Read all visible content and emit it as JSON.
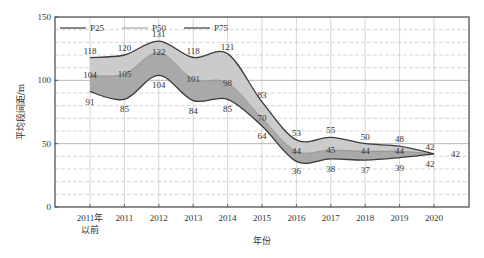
{
  "chart_data": {
    "type": "area",
    "title": "",
    "xlabel": "年份",
    "ylabel": "平均段间距/m",
    "ylim": [
      0,
      150
    ],
    "yticks": [
      0,
      50,
      100,
      150
    ],
    "grid": {
      "major_solid": [
        50,
        100
      ],
      "minor_dashed_step": 10,
      "vertical": true
    },
    "legend_position": "top-inside",
    "categories": [
      "2011年以前",
      "2011",
      "2012",
      "2013",
      "2014",
      "2015",
      "2016",
      "2017",
      "2018",
      "2019",
      "2020"
    ],
    "category_lines": [
      [
        "2011年",
        "以前"
      ],
      [
        "2011"
      ],
      [
        "2012"
      ],
      [
        "2013"
      ],
      [
        "2014"
      ],
      [
        "2015"
      ],
      [
        "2016"
      ],
      [
        "2017"
      ],
      [
        "2018"
      ],
      [
        "2019"
      ],
      [
        "2020"
      ]
    ],
    "series": [
      {
        "name": "P25",
        "values": [
          91,
          85,
          104,
          84,
          85,
          64,
          36,
          38,
          37,
          39,
          42
        ]
      },
      {
        "name": "P50",
        "values": [
          104,
          105,
          122,
          101,
          98,
          70,
          44,
          45,
          44,
          44,
          42
        ]
      },
      {
        "name": "P75",
        "values": [
          118,
          120,
          131,
          118,
          121,
          83,
          53,
          55,
          50,
          48,
          42
        ]
      }
    ],
    "colors": {
      "band_upper": "#cbcbcb",
      "band_lower": "#a9a9a9",
      "p75_line": "#3a3a3a",
      "p50_line": "#8a8a8a",
      "p25_line": "#3a3a3a"
    }
  }
}
